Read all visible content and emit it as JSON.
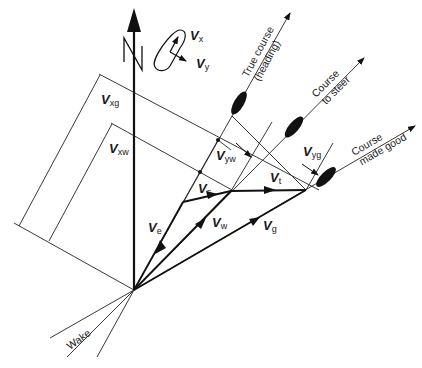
{
  "diagram": {
    "north_label": "N",
    "vectors": {
      "ve": {
        "main": "V",
        "sub": "e"
      },
      "vs": {
        "main": "V",
        "sub": "s"
      },
      "vt": {
        "main": "V",
        "sub": "t"
      },
      "vw": {
        "main": "V",
        "sub": "w"
      },
      "vg": {
        "main": "V",
        "sub": "g"
      },
      "vxg": {
        "main": "V",
        "sub": "xg"
      },
      "vxw": {
        "main": "V",
        "sub": "xw"
      },
      "vyw": {
        "main": "V",
        "sub": "yw"
      },
      "vyg": {
        "main": "V",
        "sub": "yg"
      },
      "vx": {
        "main": "V",
        "sub": "x"
      },
      "vy": {
        "main": "V",
        "sub": "y"
      }
    },
    "courses": {
      "true_course_line1": "True course",
      "true_course_line2": "(heading)",
      "course_to_steer_line1": "Course",
      "course_to_steer_line2": "to steer",
      "course_made_good_line1": "Course",
      "course_made_good_line2": "made good"
    },
    "wake_label": "Wake"
  }
}
